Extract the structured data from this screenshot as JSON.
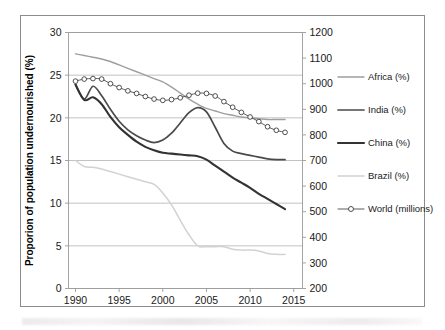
{
  "figure": {
    "background_color": "#ffffff",
    "frame_border_color": "#8c8c8c"
  },
  "chart_data": {
    "type": "line",
    "title": "",
    "subtitle": "",
    "xlabel": "",
    "ylabel": "Proporion of population undernourished (%)",
    "ylabel_secondary": "",
    "x": [
      1990,
      1991,
      1992,
      1993,
      1994,
      1995,
      1996,
      1997,
      1998,
      1999,
      2000,
      2001,
      2002,
      2003,
      2004,
      2005,
      2006,
      2007,
      2008,
      2009,
      2010,
      2011,
      2012,
      2013,
      2014
    ],
    "xlim": [
      1989.2,
      2016.0
    ],
    "xticks": [
      1990,
      1995,
      2000,
      2005,
      2010,
      2015
    ],
    "xtick_labels": [
      "1990",
      "1995",
      "2000",
      "2005",
      "2010",
      "2015"
    ],
    "ylim": [
      0,
      30
    ],
    "yticks": [
      0,
      5,
      10,
      15,
      20,
      25,
      30
    ],
    "ytick_labels": [
      "0",
      "5",
      "10",
      "15",
      "20",
      "25",
      "30"
    ],
    "ylim_secondary": [
      200,
      1200
    ],
    "yticks_secondary": [
      200,
      300,
      400,
      500,
      600,
      700,
      800,
      900,
      1000,
      1100,
      1200
    ],
    "ytick_labels_secondary": [
      "200",
      "300",
      "400",
      "500",
      "600",
      "700",
      "800",
      "900",
      "1000",
      "1100",
      "1200"
    ],
    "grid": "horizontal-major",
    "legend_position": "right",
    "series": [
      {
        "name": "Africa (%)",
        "axis": "left",
        "color": "#9e9e9e",
        "width": 1.4,
        "marker": "none",
        "values": [
          27.5,
          27.3,
          27.1,
          26.9,
          26.6,
          26.2,
          25.8,
          25.4,
          25.0,
          24.6,
          24.2,
          23.6,
          22.9,
          22.2,
          21.6,
          21.1,
          20.8,
          20.5,
          20.3,
          20.1,
          20.0,
          19.9,
          19.8,
          19.8,
          19.8
        ]
      },
      {
        "name": "India (%)",
        "axis": "left",
        "color": "#4a4a4a",
        "width": 1.7,
        "marker": "none",
        "values": [
          23.9,
          22.2,
          23.7,
          22.6,
          21.0,
          19.6,
          18.6,
          17.9,
          17.4,
          17.1,
          17.4,
          18.2,
          19.4,
          20.6,
          21.2,
          20.7,
          18.9,
          17.0,
          16.1,
          15.8,
          15.6,
          15.4,
          15.2,
          15.1,
          15.1
        ]
      },
      {
        "name": "China (%)",
        "axis": "left",
        "color": "#333333",
        "width": 2.1,
        "marker": "none",
        "values": [
          23.9,
          22.1,
          22.4,
          21.6,
          20.1,
          18.9,
          18.0,
          17.2,
          16.6,
          16.2,
          15.9,
          15.8,
          15.7,
          15.6,
          15.5,
          15.1,
          14.4,
          13.7,
          13.0,
          12.4,
          11.8,
          11.1,
          10.5,
          9.9,
          9.3
        ]
      },
      {
        "name": "Brazil (%)",
        "axis": "left",
        "color": "#d2d2d2",
        "width": 1.5,
        "marker": "none",
        "values": [
          15.0,
          14.3,
          14.2,
          14.0,
          13.7,
          13.4,
          13.1,
          12.8,
          12.5,
          12.2,
          11.2,
          9.8,
          8.0,
          6.3,
          5.0,
          4.9,
          4.9,
          4.9,
          4.6,
          4.5,
          4.5,
          4.4,
          4.1,
          4.0,
          4.0
        ]
      },
      {
        "name": "World (millions)",
        "axis": "right",
        "color": "#5a5a5a",
        "width": 1.0,
        "marker": "circle-open",
        "values": [
          1010,
          1018,
          1020,
          1018,
          1000,
          985,
          972,
          962,
          950,
          940,
          935,
          938,
          945,
          955,
          963,
          962,
          952,
          930,
          908,
          888,
          870,
          852,
          832,
          818,
          810
        ]
      }
    ]
  },
  "axes": {
    "left_title": "Proporion of population undernourished (%)",
    "left_ticks": [
      "0",
      "5",
      "10",
      "15",
      "20",
      "25",
      "30"
    ],
    "right_ticks": [
      "200",
      "300",
      "400",
      "500",
      "600",
      "700",
      "800",
      "900",
      "1000",
      "1100",
      "1200"
    ],
    "bottom_ticks": [
      "1990",
      "1995",
      "2000",
      "2005",
      "2010",
      "2015"
    ]
  },
  "legend": {
    "items": [
      {
        "label": "Africa (%)",
        "color": "#9e9e9e",
        "width": 1.4,
        "marker": "none"
      },
      {
        "label": "India (%)",
        "color": "#4a4a4a",
        "width": 1.7,
        "marker": "none"
      },
      {
        "label": "China (%)",
        "color": "#333333",
        "width": 2.1,
        "marker": "none"
      },
      {
        "label": "Brazil (%)",
        "color": "#d2d2d2",
        "width": 1.5,
        "marker": "none"
      },
      {
        "label": "World (millions)",
        "color": "#5a5a5a",
        "width": 1.0,
        "marker": "circle-open"
      }
    ]
  }
}
